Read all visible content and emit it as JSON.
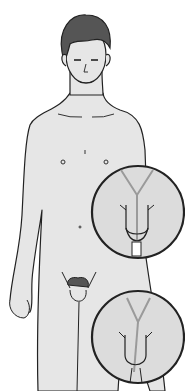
{
  "illustration": {
    "subject": "anatomical-figure-with-two-inset-magnifications",
    "colors": {
      "background": "#ffffff",
      "skin": "#e6e6e6",
      "outline": "#222222",
      "hair": "#555555",
      "duct": "#9a9a9a",
      "inset_fill": "#dcdcdc"
    },
    "insets": [
      {
        "id": "upper",
        "cx": 138,
        "cy": 212,
        "r": 46
      },
      {
        "id": "lower",
        "cx": 138,
        "cy": 337,
        "r": 46
      }
    ]
  }
}
